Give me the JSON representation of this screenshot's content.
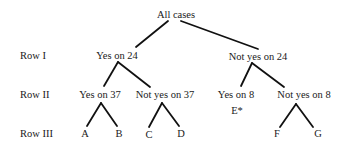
{
  "diagram": {
    "type": "tree",
    "root": {
      "label": "All cases"
    },
    "rows": [
      {
        "label": "Row I"
      },
      {
        "label": "Row II"
      },
      {
        "label": "Row III"
      }
    ],
    "nodes": {
      "all_cases": "All cases",
      "yes24": "Yes on 24",
      "not_yes24": "Not yes on 24",
      "yes37": "Yes on 37",
      "not_yes37": "Not yes on 37",
      "yes8": "Yes on 8",
      "not_yes8": "Not yes on 8",
      "A": "A",
      "B": "B",
      "C": "C",
      "D": "D",
      "E": "E*",
      "F": "F",
      "G": "G"
    },
    "edges": [
      [
        "All cases",
        "Yes on 24"
      ],
      [
        "All cases",
        "Not yes on 24"
      ],
      [
        "Yes on 24",
        "Yes on 37"
      ],
      [
        "Yes on 24",
        "Not yes on 37"
      ],
      [
        "Not yes on 24",
        "Yes on 8"
      ],
      [
        "Not yes on 24",
        "Not yes on 8"
      ],
      [
        "Yes on 37",
        "A"
      ],
      [
        "Yes on 37",
        "B"
      ],
      [
        "Not yes on 37",
        "C"
      ],
      [
        "Not yes on 37",
        "D"
      ],
      [
        "Not yes on 8",
        "F"
      ],
      [
        "Not yes on 8",
        "G"
      ]
    ],
    "colors": {
      "line": "#111111",
      "text": "#1a1a1a",
      "background": "#ffffff"
    }
  }
}
